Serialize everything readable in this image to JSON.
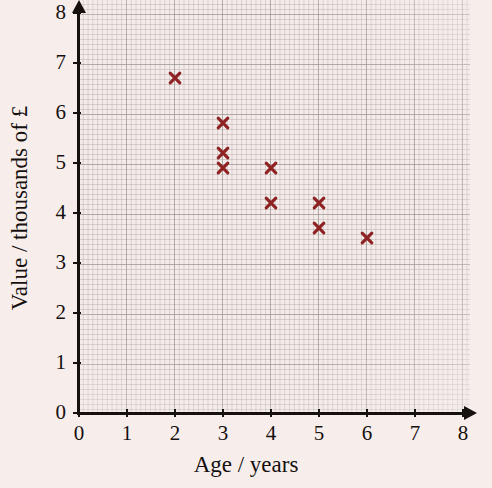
{
  "chart_data": {
    "type": "scatter",
    "title": "",
    "xlabel": "Age / years",
    "ylabel": "Value / thousands of £",
    "xlim": [
      0,
      8
    ],
    "ylim": [
      0,
      8
    ],
    "xticks": [
      "0",
      "1",
      "2",
      "3",
      "4",
      "5",
      "6",
      "7",
      "8"
    ],
    "yticks": [
      "0",
      "1",
      "2",
      "3",
      "4",
      "5",
      "6",
      "7",
      "8"
    ],
    "grid": true,
    "grid_style": "graph-paper-minor-and-major",
    "legend": "none",
    "marker": "x",
    "marker_color": "#8e2222",
    "points": [
      {
        "x": 2,
        "y": 6.7
      },
      {
        "x": 3,
        "y": 5.8
      },
      {
        "x": 3,
        "y": 5.2
      },
      {
        "x": 3,
        "y": 4.9
      },
      {
        "x": 4,
        "y": 4.9
      },
      {
        "x": 4,
        "y": 4.2
      },
      {
        "x": 5,
        "y": 4.2
      },
      {
        "x": 5,
        "y": 3.7
      },
      {
        "x": 6,
        "y": 3.5
      }
    ]
  },
  "colors": {
    "background": "#f7eeec",
    "axis": "#16100f",
    "marker": "#8e2222",
    "grid_major": "#968c8c",
    "grid_minor": "#b0a0a0"
  }
}
